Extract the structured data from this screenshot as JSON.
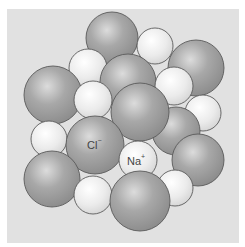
{
  "diagram": {
    "colors": {
      "background": "#ffffff",
      "panel": "#e1e1e1",
      "chloride_fill": "#9c9c9c",
      "chloride_highlight": "#dcdcdc",
      "sodium_fill": "#e6e6e6",
      "sodium_highlight": "#ffffff",
      "outline": "#5a5a5a"
    },
    "labels": {
      "chloride": {
        "base": "Cl",
        "charge": "−"
      },
      "sodium": {
        "base": "Na",
        "charge": "+"
      }
    },
    "spheres": [
      {
        "type": "Cl",
        "cx": 112,
        "cy": 38,
        "r": 26
      },
      {
        "type": "Na",
        "cx": 155,
        "cy": 46,
        "r": 18
      },
      {
        "type": "Cl",
        "cx": 196,
        "cy": 68,
        "r": 28
      },
      {
        "type": "Na",
        "cx": 88,
        "cy": 68,
        "r": 19
      },
      {
        "type": "Cl",
        "cx": 128,
        "cy": 82,
        "r": 28
      },
      {
        "type": "Na",
        "cx": 174,
        "cy": 86,
        "r": 19
      },
      {
        "type": "Cl",
        "cx": 53,
        "cy": 95,
        "r": 29
      },
      {
        "type": "Na",
        "cx": 203,
        "cy": 113,
        "r": 18
      },
      {
        "type": "Cl",
        "cx": 176,
        "cy": 131,
        "r": 24
      },
      {
        "type": "Na",
        "cx": 93,
        "cy": 100,
        "r": 19
      },
      {
        "type": "Cl",
        "cx": 140,
        "cy": 112,
        "r": 29
      },
      {
        "type": "Cl",
        "cx": 198,
        "cy": 160,
        "r": 26
      },
      {
        "type": "Na",
        "cx": 49,
        "cy": 139,
        "r": 18
      },
      {
        "type": "Cl",
        "cx": 95,
        "cy": 145,
        "r": 29
      },
      {
        "type": "Na",
        "cx": 138,
        "cy": 160,
        "r": 19
      },
      {
        "type": "Cl",
        "cx": 52,
        "cy": 179,
        "r": 28
      },
      {
        "type": "Na",
        "cx": 175,
        "cy": 188,
        "r": 18
      },
      {
        "type": "Na",
        "cx": 93,
        "cy": 195,
        "r": 19
      },
      {
        "type": "Cl",
        "cx": 140,
        "cy": 201,
        "r": 30
      }
    ]
  }
}
